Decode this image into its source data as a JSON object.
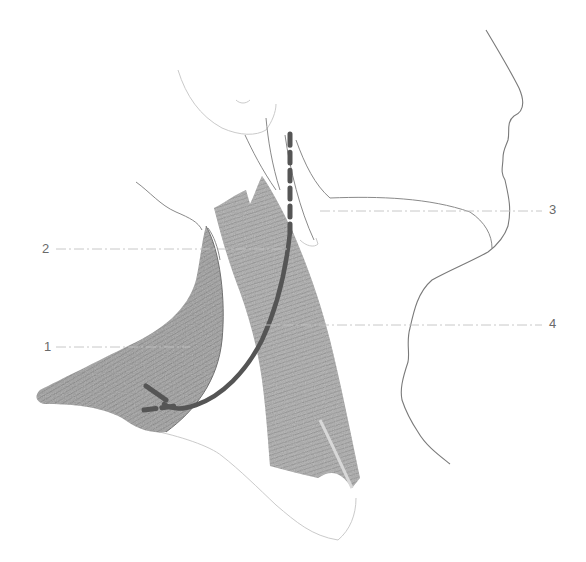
{
  "figure": {
    "type": "anatomical line drawing",
    "view": "lateral view of the neck and lower face",
    "background_color": "#ffffff",
    "muscle_shading_color": "#8c8c8c",
    "nerve_color": "#555555",
    "outline_color": "#8a8a8a",
    "label_color": "#6a6a6a"
  },
  "labels": [
    {
      "id": "1",
      "text": "1",
      "side": "left",
      "x": 44,
      "y": 340,
      "leader_to_x": 190
    },
    {
      "id": "2",
      "text": "2",
      "side": "left",
      "x": 42,
      "y": 242,
      "leader_to_x": 290
    },
    {
      "id": "3",
      "text": "3",
      "side": "right",
      "x": 549,
      "y": 203,
      "leader_to_x": 320
    },
    {
      "id": "4",
      "text": "4",
      "side": "right",
      "x": 549,
      "y": 317,
      "leader_to_x": 265
    }
  ],
  "structures": {
    "muscle_1": "trapezius (shaded, left)",
    "muscle_4": "sternocleidomastoid (shaded, center)",
    "nerve": "dashed proximal segment descending, solid curve crossing to trapezius with dashed terminal branches"
  }
}
